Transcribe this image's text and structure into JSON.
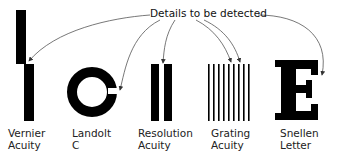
{
  "title": "Details to be detected",
  "stimuli": [
    {
      "id": "vernier",
      "line1": "Vernier",
      "line2": "Acuity"
    },
    {
      "id": "landolt",
      "line1": "Landolt",
      "line2": "C"
    },
    {
      "id": "resolution",
      "line1": "Resolution",
      "line2": "Acuity"
    },
    {
      "id": "grating",
      "line1": "Grating",
      "line2": "Acuity"
    },
    {
      "id": "snellen",
      "line1": "Snellen",
      "line2": "Letter"
    }
  ],
  "colors": {
    "ink": "#000000",
    "arrow": "#555555",
    "background": "#ffffff"
  }
}
